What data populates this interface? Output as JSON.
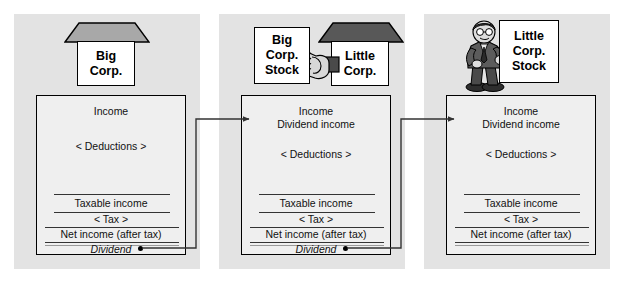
{
  "diagram": {
    "background_color": "#ffffff",
    "panel_color": "#e3e3e3",
    "statement_color": "#efefef",
    "roof_color": "#a8a8a8",
    "line_color": "#333333"
  },
  "panels": [
    {
      "id": "panel-1",
      "entity": {
        "kind": "house-icon",
        "label_lines": [
          "Big",
          "Corp."
        ]
      },
      "statement": {
        "income": "Income",
        "dividend_income": null,
        "deductions": "< Deductions >",
        "taxable_income": "Taxable income",
        "tax": "< Tax >",
        "net_income": "Net income (after tax)",
        "dividend": "Dividend"
      }
    },
    {
      "id": "panel-2",
      "entity": {
        "kind": "hand-holding-certificate",
        "certificate_lines": [
          "Big",
          "Corp.",
          "Stock"
        ],
        "house_label_lines": [
          "Little",
          "Corp."
        ]
      },
      "statement": {
        "income": "Income",
        "dividend_income": "Dividend income",
        "deductions": "< Deductions >",
        "taxable_income": "Taxable income",
        "tax": "< Tax >",
        "net_income": "Net income (after tax)",
        "dividend": "Dividend"
      }
    },
    {
      "id": "panel-3",
      "entity": {
        "kind": "person-holding-certificate",
        "certificate_lines": [
          "Little",
          "Corp.",
          "Stock"
        ]
      },
      "statement": {
        "income": "Income",
        "dividend_income": "Dividend income",
        "deductions": "< Deductions >",
        "taxable_income": "Taxable income",
        "tax": "< Tax >",
        "net_income": "Net income (after tax)",
        "dividend": null
      }
    }
  ],
  "connectors": [
    {
      "id": "flow-1-to-2",
      "from": "panel-1 Dividend",
      "to": "panel-2 Dividend income"
    },
    {
      "id": "flow-2-to-3",
      "from": "panel-2 Dividend",
      "to": "panel-3 Dividend income"
    }
  ]
}
